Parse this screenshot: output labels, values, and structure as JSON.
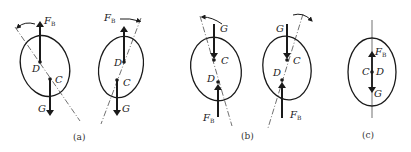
{
  "figures": [
    {
      "id": "a1",
      "caption": "",
      "labels": {
        "force_top": "F",
        "force_top_sub": "B",
        "point_d": "D",
        "point_c": "C",
        "force_bottom": "G"
      }
    },
    {
      "id": "a2",
      "caption": "",
      "labels": {
        "force_top": "F",
        "force_top_sub": "B",
        "point_d": "D",
        "point_c": "C",
        "force_bottom": "G"
      }
    },
    {
      "id": "b1",
      "caption": "",
      "labels": {
        "force_top": "G",
        "point_c": "C",
        "point_d": "D",
        "force_bottom": "F",
        "force_bottom_sub": "B"
      }
    },
    {
      "id": "b2",
      "caption": "",
      "labels": {
        "force_top": "G",
        "point_c": "C",
        "point_d": "D",
        "force_bottom": "F",
        "force_bottom_sub": "B"
      }
    },
    {
      "id": "c",
      "caption": "",
      "labels": {
        "force_top": "F",
        "force_top_sub": "B",
        "point_c": "C",
        "point_d": "D",
        "force_bottom": "G"
      }
    }
  ],
  "captions": {
    "a": "(a)",
    "b": "(b)",
    "c": "(c)"
  },
  "colors": {
    "stroke": "#1a1a1a",
    "text": "#222222",
    "background": "#ffffff"
  }
}
